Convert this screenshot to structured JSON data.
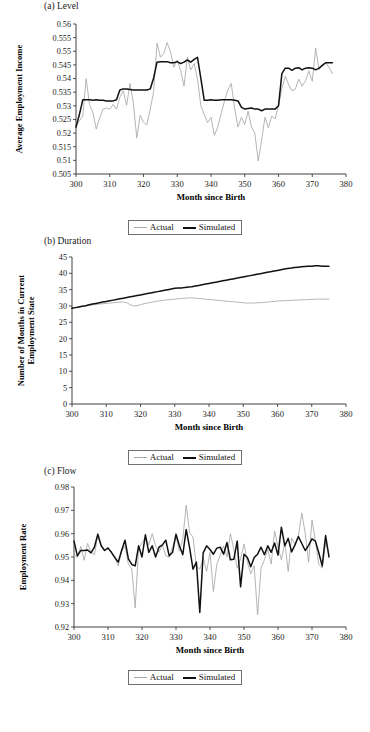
{
  "figure": {
    "legend": {
      "actual_label": "Actual",
      "simulated_label": "Simulated"
    },
    "colors": {
      "actual": "#a8a8a8",
      "simulated": "#111111",
      "axis": "#2b2b2b"
    },
    "xlabel": "Month since Birth",
    "footnote": ""
  },
  "chart_data": [
    {
      "type": "line",
      "panel": "a",
      "title": "(a) Level",
      "xlabel": "Month since Birth",
      "ylabel": "Average  Employment Income",
      "xlim": [
        300,
        380
      ],
      "ylim": [
        0.505,
        0.56
      ],
      "xticks": [
        300,
        310,
        320,
        330,
        340,
        350,
        360,
        370,
        380
      ],
      "yticks": [
        0.505,
        0.51,
        0.515,
        0.52,
        0.525,
        0.53,
        0.535,
        0.54,
        0.545,
        0.55,
        0.555,
        0.56
      ],
      "grid": false,
      "legend_position": "below",
      "x": [
        300,
        301,
        302,
        303,
        304,
        305,
        306,
        307,
        308,
        309,
        310,
        311,
        312,
        313,
        314,
        315,
        316,
        317,
        318,
        319,
        320,
        321,
        322,
        323,
        324,
        325,
        326,
        327,
        328,
        329,
        330,
        331,
        332,
        333,
        334,
        335,
        336,
        337,
        338,
        339,
        340,
        341,
        342,
        343,
        344,
        345,
        346,
        347,
        348,
        349,
        350,
        351,
        352,
        353,
        354,
        355,
        356,
        357,
        358,
        359,
        360,
        361,
        362,
        363,
        364,
        365,
        366,
        367,
        368,
        369,
        370,
        371,
        372,
        373,
        374,
        375,
        376
      ],
      "series": [
        {
          "name": "Actual",
          "values": [
            0.5225,
            0.5245,
            0.5262,
            0.54,
            0.5305,
            0.5275,
            0.5215,
            0.5255,
            0.5288,
            0.5292,
            0.5288,
            0.5305,
            0.5288,
            0.5332,
            0.5355,
            0.5302,
            0.5382,
            0.531,
            0.5182,
            0.5265,
            0.524,
            0.523,
            0.5288,
            0.5352,
            0.553,
            0.5478,
            0.5492,
            0.5532,
            0.5498,
            0.5442,
            0.5468,
            0.543,
            0.5372,
            0.5478,
            0.5432,
            0.5455,
            0.5398,
            0.53,
            0.5268,
            0.5238,
            0.5258,
            0.5192,
            0.5222,
            0.5272,
            0.5318,
            0.5358,
            0.5382,
            0.529,
            0.5222,
            0.5258,
            0.5232,
            0.528,
            0.5222,
            0.5198,
            0.5098,
            0.5175,
            0.5258,
            0.522,
            0.5262,
            0.5252,
            0.53,
            0.5362,
            0.5408,
            0.5378,
            0.5355,
            0.5362,
            0.5398,
            0.5372,
            0.5392,
            0.5428,
            0.539,
            0.5512,
            0.5432,
            0.5452,
            0.5458,
            0.544,
            0.5418
          ]
        },
        {
          "name": "Simulated",
          "values": [
            0.5222,
            0.5268,
            0.5322,
            0.5322,
            0.5322,
            0.532,
            0.5322,
            0.532,
            0.532,
            0.5318,
            0.5318,
            0.5318,
            0.5322,
            0.5358,
            0.5362,
            0.5362,
            0.536,
            0.5358,
            0.5358,
            0.5358,
            0.5358,
            0.5358,
            0.5362,
            0.5402,
            0.546,
            0.5462,
            0.5462,
            0.5462,
            0.5458,
            0.5458,
            0.5462,
            0.5455,
            0.546,
            0.5468,
            0.546,
            0.547,
            0.5478,
            0.54,
            0.532,
            0.532,
            0.5322,
            0.532,
            0.532,
            0.5322,
            0.5322,
            0.5322,
            0.5322,
            0.532,
            0.5318,
            0.5295,
            0.5288,
            0.529,
            0.5292,
            0.5288,
            0.5288,
            0.5282,
            0.5288,
            0.5288,
            0.5288,
            0.5288,
            0.53,
            0.5418,
            0.5438,
            0.5438,
            0.543,
            0.5438,
            0.544,
            0.5432,
            0.5438,
            0.544,
            0.5438,
            0.5432,
            0.5438,
            0.5448,
            0.5458,
            0.5458,
            0.5458
          ]
        }
      ]
    },
    {
      "type": "line",
      "panel": "b",
      "title": "(b) Duration",
      "xlabel": "Month since Birth",
      "ylabel": "Number of Months in Current Employment State",
      "xlim": [
        300,
        380
      ],
      "ylim": [
        0,
        45
      ],
      "xticks": [
        300,
        310,
        320,
        330,
        340,
        350,
        360,
        370,
        380
      ],
      "yticks": [
        0,
        5,
        10,
        15,
        20,
        25,
        30,
        35,
        40,
        45
      ],
      "grid": false,
      "legend_position": "below",
      "x": [
        300,
        301,
        302,
        303,
        304,
        305,
        306,
        307,
        308,
        309,
        310,
        311,
        312,
        313,
        314,
        315,
        316,
        317,
        318,
        319,
        320,
        321,
        322,
        323,
        324,
        325,
        326,
        327,
        328,
        329,
        330,
        331,
        332,
        333,
        334,
        335,
        336,
        337,
        338,
        339,
        340,
        341,
        342,
        343,
        344,
        345,
        346,
        347,
        348,
        349,
        350,
        351,
        352,
        353,
        354,
        355,
        356,
        357,
        358,
        359,
        360,
        361,
        362,
        363,
        364,
        365,
        366,
        367,
        368,
        369,
        370,
        371,
        372,
        373,
        374,
        375
      ],
      "series": [
        {
          "name": "Actual",
          "values": [
            29.3,
            29.5,
            29.7,
            29.9,
            30.0,
            30.2,
            30.3,
            30.5,
            30.6,
            30.7,
            30.8,
            30.9,
            31.0,
            31.1,
            31.2,
            31.2,
            31.0,
            30.4,
            30.0,
            30.1,
            30.4,
            30.7,
            30.9,
            31.1,
            31.3,
            31.5,
            31.6,
            31.8,
            31.9,
            32.0,
            32.1,
            32.2,
            32.3,
            32.4,
            32.5,
            32.5,
            32.4,
            32.3,
            32.2,
            32.1,
            32.0,
            31.9,
            31.8,
            31.7,
            31.6,
            31.5,
            31.4,
            31.3,
            31.2,
            31.1,
            31.0,
            30.9,
            30.9,
            30.9,
            31.0,
            31.0,
            31.1,
            31.2,
            31.3,
            31.4,
            31.5,
            31.6,
            31.6,
            31.7,
            31.7,
            31.8,
            31.8,
            31.9,
            31.9,
            32.0,
            32.0,
            32.1,
            32.1,
            32.1,
            32.1,
            32.1
          ]
        },
        {
          "name": "Simulated",
          "values": [
            29.3,
            29.5,
            29.7,
            29.9,
            30.1,
            30.4,
            30.6,
            30.8,
            31.0,
            31.2,
            31.4,
            31.6,
            31.8,
            32.0,
            32.2,
            32.4,
            32.6,
            32.8,
            33.0,
            33.2,
            33.4,
            33.6,
            33.8,
            34.0,
            34.2,
            34.4,
            34.6,
            34.8,
            35.0,
            35.2,
            35.4,
            35.5,
            35.5,
            35.7,
            35.8,
            35.9,
            36.1,
            36.3,
            36.5,
            36.7,
            36.9,
            37.1,
            37.3,
            37.5,
            37.7,
            37.9,
            38.1,
            38.3,
            38.5,
            38.7,
            38.9,
            39.1,
            39.3,
            39.5,
            39.7,
            39.9,
            40.1,
            40.3,
            40.5,
            40.7,
            40.9,
            41.1,
            41.3,
            41.5,
            41.6,
            41.8,
            41.9,
            42.0,
            42.1,
            42.2,
            42.2,
            42.3,
            42.3,
            42.2,
            42.2,
            42.2
          ]
        }
      ]
    },
    {
      "type": "line",
      "panel": "c",
      "title": "(c) Flow",
      "xlabel": "Month since Birth",
      "ylabel": "Employment Rate",
      "xlim": [
        300,
        380
      ],
      "ylim": [
        0.92,
        0.98
      ],
      "xticks": [
        300,
        310,
        320,
        330,
        340,
        350,
        360,
        370,
        380
      ],
      "yticks": [
        0.92,
        0.93,
        0.94,
        0.95,
        0.96,
        0.97,
        0.98
      ],
      "grid": false,
      "legend_position": "below",
      "x": [
        300,
        301,
        302,
        303,
        304,
        305,
        306,
        307,
        308,
        309,
        310,
        311,
        312,
        313,
        314,
        315,
        316,
        317,
        318,
        319,
        320,
        321,
        322,
        323,
        324,
        325,
        326,
        327,
        328,
        329,
        330,
        331,
        332,
        333,
        334,
        335,
        336,
        337,
        338,
        339,
        340,
        341,
        342,
        343,
        344,
        345,
        346,
        347,
        348,
        349,
        350,
        351,
        352,
        353,
        354,
        355,
        356,
        357,
        358,
        359,
        360,
        361,
        362,
        363,
        364,
        365,
        366,
        367,
        368,
        369,
        370,
        371,
        372,
        373,
        374,
        375
      ],
      "series": [
        {
          "name": "Actual",
          "values": [
            0.9512,
            0.9498,
            0.9545,
            0.9486,
            0.9558,
            0.952,
            0.951,
            0.959,
            0.9548,
            0.9528,
            0.9542,
            0.952,
            0.9498,
            0.9462,
            0.9522,
            0.9548,
            0.947,
            0.9448,
            0.9282,
            0.9538,
            0.956,
            0.9585,
            0.9552,
            0.96,
            0.9548,
            0.952,
            0.9552,
            0.9505,
            0.9498,
            0.9545,
            0.9588,
            0.9525,
            0.9578,
            0.9722,
            0.9605,
            0.9585,
            0.946,
            0.9448,
            0.9498,
            0.9438,
            0.952,
            0.9352,
            0.9468,
            0.9508,
            0.9548,
            0.95,
            0.96,
            0.9532,
            0.9452,
            0.9492,
            0.9556,
            0.9478,
            0.9428,
            0.9462,
            0.9252,
            0.9452,
            0.9488,
            0.9532,
            0.947,
            0.9612,
            0.9542,
            0.9488,
            0.9562,
            0.9438,
            0.9582,
            0.9552,
            0.959,
            0.9688,
            0.9602,
            0.9478,
            0.9658,
            0.9568,
            0.9468,
            0.9452,
            0.9562,
            0.9512
          ]
        },
        {
          "name": "Simulated",
          "values": [
            0.9568,
            0.9505,
            0.9528,
            0.9528,
            0.953,
            0.9518,
            0.9542,
            0.9598,
            0.9548,
            0.9528,
            0.9538,
            0.952,
            0.9498,
            0.9478,
            0.9528,
            0.9572,
            0.9492,
            0.9468,
            0.9462,
            0.9548,
            0.95,
            0.9595,
            0.952,
            0.9548,
            0.95,
            0.9542,
            0.9552,
            0.9572,
            0.9505,
            0.952,
            0.9598,
            0.9548,
            0.951,
            0.9618,
            0.954,
            0.9448,
            0.9478,
            0.9262,
            0.9518,
            0.9548,
            0.9532,
            0.9512,
            0.9538,
            0.9542,
            0.9512,
            0.9562,
            0.9488,
            0.949,
            0.9568,
            0.9372,
            0.9512,
            0.9498,
            0.9458,
            0.9498,
            0.9512,
            0.9542,
            0.951,
            0.9548,
            0.952,
            0.956,
            0.9508,
            0.9628,
            0.9548,
            0.958,
            0.9522,
            0.9552,
            0.9588,
            0.9558,
            0.9528,
            0.955,
            0.9578,
            0.9568,
            0.9518,
            0.9462,
            0.9592,
            0.95
          ]
        }
      ]
    }
  ]
}
